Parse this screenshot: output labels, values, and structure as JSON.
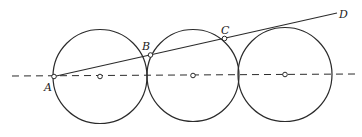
{
  "diagram": {
    "type": "geometry",
    "stroke_color": "#2b2b2b",
    "background": "#ffffff",
    "centerline": {
      "x1": 12,
      "y1": 76,
      "x2": 356,
      "y2": 74,
      "style": "dashed"
    },
    "circles": [
      {
        "id": "circle-1",
        "cx": 100,
        "cy": 76.5,
        "r": 47
      },
      {
        "id": "circle-2",
        "cx": 193,
        "cy": 75.5,
        "r": 46
      },
      {
        "id": "circle-3",
        "cx": 285,
        "cy": 74.5,
        "r": 47
      }
    ],
    "centers": [
      {
        "id": "center-1",
        "x": 100,
        "y": 76.5
      },
      {
        "id": "center-2",
        "x": 193,
        "y": 75.5
      },
      {
        "id": "center-3",
        "x": 285,
        "y": 74.5
      }
    ],
    "line_AD": {
      "x1": 54,
      "y1": 76.5,
      "x2": 337,
      "y2": 13
    },
    "points": [
      {
        "id": "A",
        "label": "A",
        "x": 54,
        "y": 76.5,
        "label_x": 44,
        "label_y": 91
      },
      {
        "id": "B",
        "label": "B",
        "x": 150.5,
        "y": 55,
        "label_x": 142,
        "label_y": 50
      },
      {
        "id": "C",
        "label": "C",
        "x": 224.5,
        "y": 38.5,
        "label_x": 221,
        "label_y": 34
      },
      {
        "id": "D",
        "label": "D",
        "x": 337,
        "y": 13,
        "label_x": 339,
        "label_y": 18
      }
    ]
  }
}
